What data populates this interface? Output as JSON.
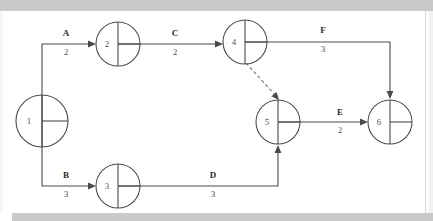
{
  "diagram": {
    "type": "activity-on-arrow-network",
    "title": "",
    "canvas": {
      "width": 433,
      "height": 221
    },
    "colors": {
      "stroke": "#4a4a4a",
      "label": "#2b2b2b",
      "scan_band": "#c9c9c9",
      "background": "#ffffff"
    },
    "nodes": [
      {
        "id": "n1",
        "label": "1",
        "cx": 42,
        "cy": 121,
        "r": 26
      },
      {
        "id": "n2",
        "label": "2",
        "cx": 118,
        "cy": 44,
        "r": 22
      },
      {
        "id": "n3",
        "label": "3",
        "cx": 118,
        "cy": 186,
        "r": 22
      },
      {
        "id": "n4",
        "label": "4",
        "cx": 245,
        "cy": 42,
        "r": 22
      },
      {
        "id": "n5",
        "label": "5",
        "cx": 278,
        "cy": 122,
        "r": 22
      },
      {
        "id": "n6",
        "label": "6",
        "cx": 390,
        "cy": 122,
        "r": 22
      }
    ],
    "edges": [
      {
        "id": "eA",
        "label": "A",
        "duration": "2",
        "from": "1",
        "to": "2",
        "style": "solid",
        "label_x": 66,
        "label_y": 36,
        "dur_x": 66,
        "dur_y": 55
      },
      {
        "id": "eB",
        "label": "B",
        "duration": "3",
        "from": "1",
        "to": "3",
        "style": "solid",
        "label_x": 66,
        "label_y": 178,
        "dur_x": 66,
        "dur_y": 197
      },
      {
        "id": "eC",
        "label": "C",
        "duration": "2",
        "from": "2",
        "to": "4",
        "style": "solid",
        "label_x": 175,
        "label_y": 36,
        "dur_x": 175,
        "dur_y": 55
      },
      {
        "id": "eD",
        "label": "D",
        "duration": "3",
        "from": "3",
        "to": "5",
        "style": "solid",
        "label_x": 213,
        "label_y": 178,
        "dur_x": 213,
        "dur_y": 197
      },
      {
        "id": "eE",
        "label": "E",
        "duration": "2",
        "from": "5",
        "to": "6",
        "style": "solid",
        "label_x": 340,
        "label_y": 115,
        "dur_x": 340,
        "dur_y": 133
      },
      {
        "id": "eF",
        "label": "F",
        "duration": "3",
        "from": "4",
        "to": "6",
        "style": "solid",
        "label_x": 323,
        "label_y": 33,
        "dur_x": 323,
        "dur_y": 52
      },
      {
        "id": "eDummy",
        "label": "",
        "duration": "",
        "from": "4",
        "to": "5",
        "style": "dashed",
        "label_x": 0,
        "label_y": 0,
        "dur_x": 0,
        "dur_y": 0
      }
    ]
  }
}
